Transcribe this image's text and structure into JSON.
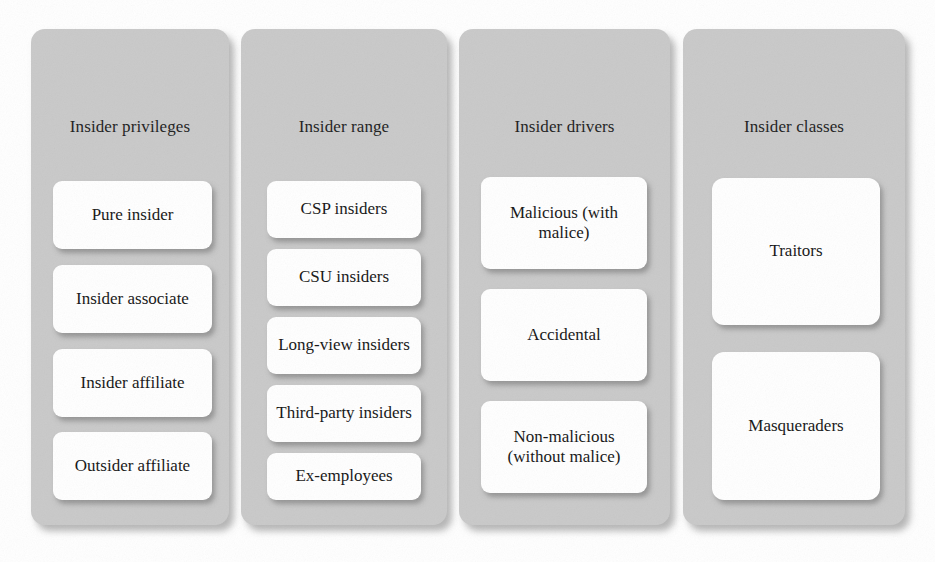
{
  "figure": {
    "kind": "taxonomy-diagram",
    "orientation": "four parallel category columns",
    "background_color": "#ffffff",
    "panel_color": "#c9c9c9",
    "node_color": "#ffffff",
    "text_color": "#141414"
  },
  "columns": [
    {
      "title": "Insider privileges",
      "nodes": [
        {
          "label": "Pure insider"
        },
        {
          "label": "Insider associate"
        },
        {
          "label": "Insider affiliate"
        },
        {
          "label": "Outsider affiliate"
        }
      ]
    },
    {
      "title": "Insider range",
      "nodes": [
        {
          "label": "CSP insiders"
        },
        {
          "label": "CSU insiders"
        },
        {
          "label": "Long-view insiders"
        },
        {
          "label": "Third-party insiders"
        },
        {
          "label": "Ex-employees"
        }
      ]
    },
    {
      "title": "Insider drivers",
      "nodes": [
        {
          "label": "Malicious (with malice)"
        },
        {
          "label": "Accidental"
        },
        {
          "label": "Non-malicious (without malice)"
        }
      ]
    },
    {
      "title": "Insider classes",
      "nodes": [
        {
          "label": "Traitors"
        },
        {
          "label": "Masqueraders"
        }
      ]
    }
  ]
}
